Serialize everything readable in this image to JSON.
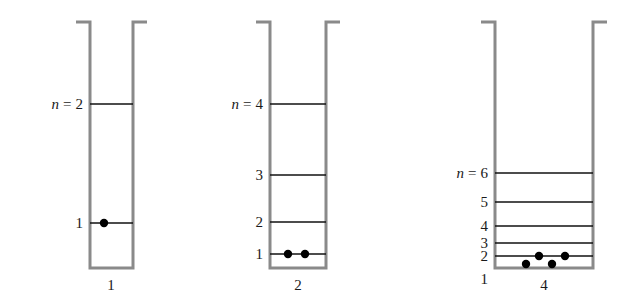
{
  "figure": {
    "colors": {
      "wall": "#8a8a8a",
      "level": "#111111",
      "electron": "#000000",
      "text": "#1a1a1a",
      "background": "#ffffff"
    },
    "n_prefix": "n",
    "equals": "="
  },
  "chart_data": {
    "type": "diagram",
    "xlabel": "Well width",
    "ylabel": "Energy level",
    "wells": [
      {
        "id": "well-1",
        "width_label": "1",
        "wall_left_x": 90,
        "wall_right_x": 133,
        "top_y": 22,
        "bottom_y": 268,
        "lip_len": 14,
        "width_label_x": 111,
        "width_label_y": 290,
        "top_level_prefix_shown": true,
        "top_level_prefix_text": "n = 2",
        "levels": [
          {
            "n": 1,
            "label": "1",
            "y": 223,
            "electrons": 1,
            "electron_xs": [
              104
            ]
          },
          {
            "n": 2,
            "label": "2",
            "y": 104,
            "electrons": 0,
            "electron_xs": []
          }
        ]
      },
      {
        "id": "well-2",
        "width_label": "2",
        "wall_left_x": 270,
        "wall_right_x": 326,
        "top_y": 22,
        "bottom_y": 268,
        "lip_len": 14,
        "width_label_x": 298,
        "width_label_y": 290,
        "top_level_prefix_shown": true,
        "top_level_prefix_text": "n = 4",
        "levels": [
          {
            "n": 1,
            "label": "1",
            "y": 254,
            "electrons": 2,
            "electron_xs": [
              288,
              305
            ]
          },
          {
            "n": 2,
            "label": "2",
            "y": 222,
            "electrons": 0,
            "electron_xs": []
          },
          {
            "n": 3,
            "label": "3",
            "y": 175,
            "electrons": 0,
            "electron_xs": []
          },
          {
            "n": 4,
            "label": "4",
            "y": 104,
            "electrons": 0,
            "electron_xs": []
          }
        ]
      },
      {
        "id": "well-3",
        "width_label": "4",
        "wall_left_x": 495,
        "wall_right_x": 593,
        "top_y": 22,
        "bottom_y": 268,
        "lip_len": 14,
        "width_label_x": 544,
        "width_label_y": 290,
        "top_level_prefix_shown": true,
        "top_level_prefix_text": "n = 6",
        "levels": [
          {
            "n": 1,
            "label": "1",
            "y": 264,
            "electrons": 2,
            "electron_xs": [
              526,
              552
            ],
            "label_outside_below": true
          },
          {
            "n": 2,
            "label": "2",
            "y": 256,
            "electrons": 2,
            "electron_xs": [
              539,
              565
            ]
          },
          {
            "n": 3,
            "label": "3",
            "y": 243,
            "electrons": 0,
            "electron_xs": []
          },
          {
            "n": 4,
            "label": "4",
            "y": 226,
            "electrons": 0,
            "electron_xs": []
          },
          {
            "n": 5,
            "label": "5",
            "y": 202,
            "electrons": 0,
            "electron_xs": []
          },
          {
            "n": 6,
            "label": "6",
            "y": 173,
            "electrons": 0,
            "electron_xs": []
          }
        ]
      }
    ],
    "notes": [
      "Energy levels scale as n^2 / L^2 for an infinite square well.",
      "Each level holds at most two electrons (spin up and spin down)."
    ]
  }
}
